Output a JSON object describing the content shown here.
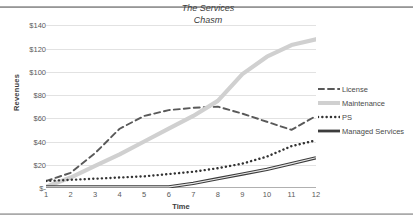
{
  "chart_data": {
    "type": "line",
    "title": "",
    "annotation": "The Services Chasm",
    "annotation_line1": "The Services",
    "annotation_line2": "Chasm",
    "xlabel": "Time",
    "ylabel": "Revenues",
    "x": [
      1,
      2,
      3,
      4,
      5,
      6,
      7,
      8,
      9,
      10,
      11,
      12
    ],
    "xticklabels": [
      "1",
      "2",
      "3",
      "4",
      "5",
      "6",
      "7",
      "8",
      "9",
      "10",
      "11",
      "12"
    ],
    "yticklabels": [
      "$140",
      "$120",
      "$100",
      "$80",
      "$60",
      "$40",
      "$20",
      "$-"
    ],
    "ytickvalues": [
      140,
      120,
      100,
      80,
      60,
      40,
      20,
      0
    ],
    "ylim": [
      0,
      148
    ],
    "xlim": [
      1,
      12
    ],
    "grid": true,
    "legend_position": "right",
    "series": [
      {
        "name": "License",
        "style": "dashed",
        "color": "#595959",
        "values": [
          6,
          13,
          30,
          51,
          62,
          67,
          69,
          70,
          64,
          57,
          50,
          62
        ]
      },
      {
        "name": "Maintenance",
        "style": "solid-light",
        "color": "#d0d0d0",
        "values": [
          1,
          9,
          19,
          29,
          40,
          51,
          62,
          75,
          98,
          113,
          123,
          128
        ]
      },
      {
        "name": "PS",
        "style": "dotted",
        "color": "#333333",
        "values": [
          6,
          7,
          8,
          9,
          10,
          12,
          14,
          17,
          21,
          27,
          36,
          41
        ]
      },
      {
        "name": "Managed Services",
        "style": "solid-heavy",
        "color": "#3c3c3c",
        "values": [
          1,
          1,
          1,
          1,
          1,
          1,
          4,
          8,
          12,
          16,
          21,
          26
        ]
      }
    ]
  }
}
